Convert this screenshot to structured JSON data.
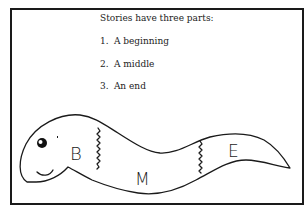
{
  "figure": {
    "heading": "Stories have three parts:",
    "items": [
      {
        "number": "1.",
        "text": "A beginning"
      },
      {
        "number": "2.",
        "text": "A middle"
      },
      {
        "number": "3.",
        "text": "An end"
      }
    ],
    "worm": {
      "segments": [
        {
          "letter": "B",
          "meaning": "beginning"
        },
        {
          "letter": "M",
          "meaning": "middle"
        },
        {
          "letter": "E",
          "meaning": "end"
        }
      ]
    },
    "colors": {
      "line": "#1a1a1a",
      "background": "#ffffff"
    }
  }
}
